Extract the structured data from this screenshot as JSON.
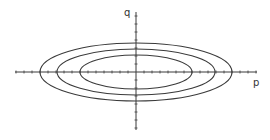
{
  "diagram": {
    "type": "phase-portrait",
    "axes": {
      "x_label": "p",
      "y_label": "q",
      "origin": [
        136,
        72
      ],
      "x_range_px": [
        15,
        257
      ],
      "y_range_px": [
        12,
        130
      ],
      "tick_spacing_px": 8
    },
    "curves": [
      {
        "name": "inner-ellipse",
        "rx": 56,
        "ry": 17
      },
      {
        "name": "middle-ellipse",
        "rx": 79,
        "ry": 23
      },
      {
        "name": "outer-ellipse",
        "rx": 96,
        "ry": 29
      }
    ],
    "colors": {
      "line": "#3a3a3a",
      "background": "#ffffff"
    }
  }
}
